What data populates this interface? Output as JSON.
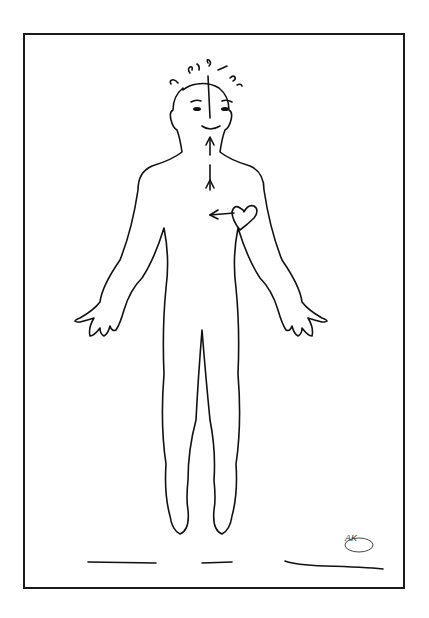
{
  "illustration": {
    "subject": "human-figure-outline",
    "elements": [
      "frame",
      "figure-outline",
      "hair",
      "eyes",
      "smile",
      "center-arrow-line",
      "heart",
      "ground-line",
      "signature"
    ],
    "signature_text": "AK",
    "colors": {
      "line": "#111111",
      "background": "#ffffff",
      "frame": "#1a1a1a"
    }
  }
}
